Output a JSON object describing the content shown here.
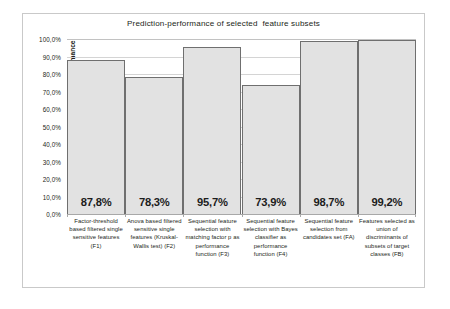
{
  "chart_data": {
    "type": "bar",
    "title": "Prediction-performance of selected  feature subsets",
    "xlabel": "",
    "ylabel": "Prediction performance",
    "ylim": [
      0,
      100
    ],
    "grid": true,
    "legend": "none",
    "categories": [
      "Factor-threshold based filtered single sensitive features (F1)",
      "Anova based filtered sensitive single features (Kruskal-Wallis test) (F2)",
      "Sequential feature selection with matching factor p as performance function (F3)",
      "Sequential feature selection with Bayes classifier as performance function (F4)",
      "Sequential feature selection from candidates set (FA)",
      "Features selected as union of discriminants of subsets of target classes (FB)"
    ],
    "values": [
      87.8,
      78.3,
      95.7,
      73.9,
      98.7,
      99.2
    ],
    "data_labels": [
      "87,8%",
      "78,3%",
      "95,7%",
      "73,9%",
      "98,7%",
      "99,2%"
    ],
    "ytick_labels": [
      "100,0%",
      "90,0%",
      "80,0%",
      "70,0%",
      "60,0%",
      "50,0%",
      "40,0%",
      "30,0%",
      "20,0%",
      "10,0%",
      "0,0%"
    ],
    "ytick_values": [
      100,
      90,
      80,
      70,
      60,
      50,
      40,
      30,
      20,
      10,
      0
    ],
    "colors": {
      "bar_fill": "#e2e2e2",
      "bar_outline": "#6f6f6f",
      "gridline": "#d4d4d4",
      "frame": "#c9c9c9",
      "text": "#231f20"
    }
  }
}
